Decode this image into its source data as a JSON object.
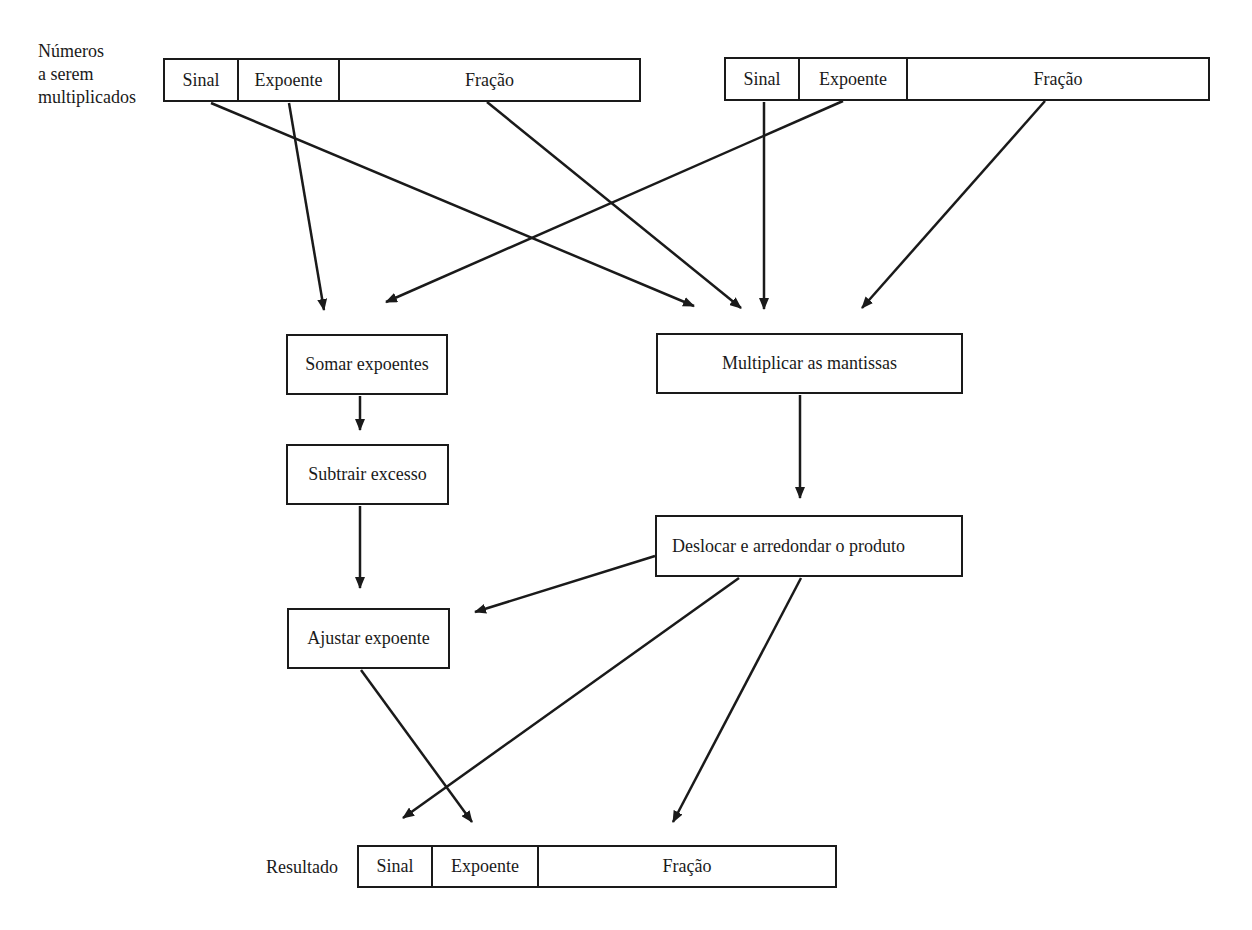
{
  "title_label": {
    "lines": [
      "Números",
      "a serem",
      "multiplicados"
    ]
  },
  "operands": [
    {
      "fields": [
        "Sinal",
        "Expoente",
        "Fração"
      ]
    },
    {
      "fields": [
        "Sinal",
        "Expoente",
        "Fração"
      ]
    }
  ],
  "steps": {
    "add_exponents": "Somar expoentes",
    "subtract_bias": "Subtrair excesso",
    "adjust_exponent": "Ajustar expoente",
    "multiply_mantissas": "Multiplicar as mantissas",
    "shift_round": "Deslocar e arredondar o produto"
  },
  "result": {
    "label": "Resultado",
    "fields": [
      "Sinal",
      "Expoente",
      "Fração"
    ]
  },
  "colors": {
    "stroke": "#1a1a1a",
    "background": "#ffffff"
  }
}
